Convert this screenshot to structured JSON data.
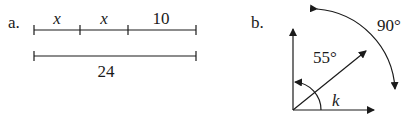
{
  "figure_a": {
    "label": "a.",
    "segments": [
      {
        "label": "x",
        "italic": true
      },
      {
        "label": "x",
        "italic": true
      },
      {
        "label": "10",
        "italic": false
      }
    ],
    "total_label": "24"
  },
  "figure_b": {
    "label": "b.",
    "inner_angle_label": "55°",
    "outer_angle_label": "90°",
    "unknown_angle_label": "k"
  }
}
